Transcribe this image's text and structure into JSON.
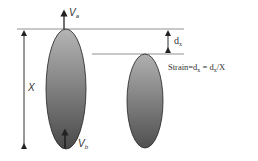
{
  "diagram": {
    "title": "",
    "labels": {
      "velocity_top": "V",
      "velocity_top_sub": "a",
      "velocity_bottom": "V",
      "velocity_bottom_sub": "b",
      "length": "X",
      "displacement": "d",
      "displacement_sub": "x",
      "strain_prefix": "Strain=d",
      "strain_sub1": "x",
      "strain_mid": " = d",
      "strain_sub2": "x",
      "strain_suffix": "/X"
    },
    "shapes": [
      {
        "name": "original-cell",
        "description": "tall ellipse, length X"
      },
      {
        "name": "deformed-cell",
        "description": "shorter ellipse after displacement d_x"
      }
    ],
    "colors": {
      "line": "#555555",
      "ellipse_fill_light": "#b8b8b8",
      "ellipse_fill_dark": "#555555",
      "ellipse_stroke": "#222222",
      "arrow": "#222222"
    }
  }
}
